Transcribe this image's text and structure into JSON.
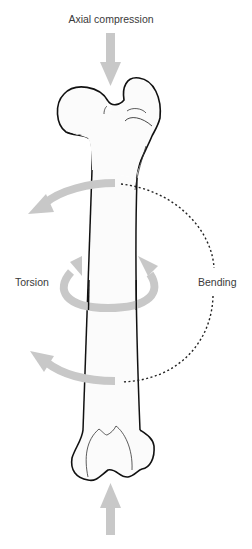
{
  "diagram": {
    "title": "Axial compression",
    "labels": {
      "torsion": "Torsion",
      "bending": "Bending"
    },
    "colors": {
      "arrow": "#c8c8c8",
      "outline": "#111111",
      "dotted_arc": "#222222",
      "text": "#3a3a3a",
      "background": "#ffffff"
    },
    "forces": [
      {
        "name": "axial-compression-top",
        "direction": "down"
      },
      {
        "name": "axial-compression-bottom",
        "direction": "up"
      },
      {
        "name": "torsion",
        "direction": "rotational"
      },
      {
        "name": "bending",
        "direction": "curved-left"
      }
    ]
  }
}
